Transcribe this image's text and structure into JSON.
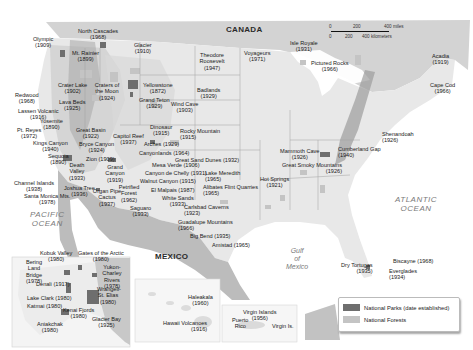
{
  "map": {
    "countries": {
      "canada": "CANADA",
      "mexico": "MEXICO"
    },
    "oceans": {
      "pacific": "PACIFIC\nOCEAN",
      "atlantic": "ATLANTIC\nOCEAN",
      "gulf": "Gulf\nof\nMexico"
    },
    "scale": {
      "miles": [
        "0",
        "200",
        "400 miles"
      ],
      "km": [
        "0",
        "200",
        "400 kilometers"
      ]
    },
    "parks": [
      {
        "name": "Olympic",
        "year": "1909"
      },
      {
        "name": "North Cascades",
        "year": "1968"
      },
      {
        "name": "Mt. Rainier",
        "year": "1899"
      },
      {
        "name": "Glacier",
        "year": "1910"
      },
      {
        "name": "Crater Lake",
        "year": "1902"
      },
      {
        "name": "Craters of the Moon",
        "year": "1924"
      },
      {
        "name": "Redwood",
        "year": "1968"
      },
      {
        "name": "Lava Beds",
        "year": "1925"
      },
      {
        "name": "Lassen Volcanic",
        "year": "1916"
      },
      {
        "name": "Yosemite",
        "year": "1890"
      },
      {
        "name": "Pt. Reyes",
        "year": "1972"
      },
      {
        "name": "Kings Canyon",
        "year": "1940"
      },
      {
        "name": "Sequoia",
        "year": "1890"
      },
      {
        "name": "Great Basin",
        "year": "1922"
      },
      {
        "name": "Capitol Reef",
        "year": "1937"
      },
      {
        "name": "Bryce Canyon",
        "year": "1924"
      },
      {
        "name": "Zion",
        "year": "1909"
      },
      {
        "name": "Death Valley",
        "year": "1933"
      },
      {
        "name": "Grand Canyon",
        "year": "1919"
      },
      {
        "name": "Channel Islands",
        "year": "1938"
      },
      {
        "name": "Joshua Tree",
        "year": "1936"
      },
      {
        "name": "Organ Pipe Cactus",
        "year": "1937"
      },
      {
        "name": "Petrified Forest",
        "year": "1962"
      },
      {
        "name": "Saguaro",
        "year": "1933"
      },
      {
        "name": "Santa Monica Mts.",
        "year": "1978"
      },
      {
        "name": "Yellowstone",
        "year": "1872"
      },
      {
        "name": "Grand Teton",
        "year": "1929"
      },
      {
        "name": "Wind Cave",
        "year": "1903"
      },
      {
        "name": "Theodore Roosevelt",
        "year": "1947"
      },
      {
        "name": "Badlands",
        "year": "1929"
      },
      {
        "name": "Voyageurs",
        "year": "1971"
      },
      {
        "name": "Isle Royale",
        "year": "1931"
      },
      {
        "name": "Pictured Rocks",
        "year": "1966"
      },
      {
        "name": "Acadia",
        "year": "1919"
      },
      {
        "name": "Cape Cod",
        "year": "1966"
      },
      {
        "name": "Dinosaur",
        "year": "1915"
      },
      {
        "name": "Rocky Mountain",
        "year": "1915"
      },
      {
        "name": "Arches",
        "year": "1929"
      },
      {
        "name": "Canyonlands",
        "year": "1964"
      },
      {
        "name": "Great Sand Dunes",
        "year": "1932"
      },
      {
        "name": "Mesa Verde",
        "year": "1906"
      },
      {
        "name": "Canyon de Chelly",
        "year": "1931"
      },
      {
        "name": "Walnut Canyon",
        "year": "1915"
      },
      {
        "name": "Lake Meredith",
        "year": "1965"
      },
      {
        "name": "Alibates Flint Quarries",
        "year": "1965"
      },
      {
        "name": "El Malpais",
        "year": "1987"
      },
      {
        "name": "White Sands",
        "year": "1933"
      },
      {
        "name": "Carlsbad Caverns",
        "year": "1923"
      },
      {
        "name": "Guadalupe Mountains",
        "year": "1966"
      },
      {
        "name": "Big Bend",
        "year": "1935"
      },
      {
        "name": "Amistad",
        "year": "1965"
      },
      {
        "name": "Hot Springs",
        "year": "1921"
      },
      {
        "name": "Mammoth Cave",
        "year": "1926"
      },
      {
        "name": "Great Smoky Mountains",
        "year": "1926"
      },
      {
        "name": "Cumberland Gap",
        "year": "1940"
      },
      {
        "name": "Shenandoah",
        "year": "1926"
      },
      {
        "name": "Dry Tortugas",
        "year": "1935"
      },
      {
        "name": "Biscayne",
        "year": "1968"
      },
      {
        "name": "Everglades",
        "year": "1934"
      }
    ],
    "alaska": [
      {
        "name": "Kobuk Valley",
        "year": "1980"
      },
      {
        "name": "Gates of the Arctic",
        "year": "1980"
      },
      {
        "name": "Bering Land Bridge",
        "year": "1978"
      },
      {
        "name": "Yukon-Charley Rivers",
        "year": "1978"
      },
      {
        "name": "Denali",
        "year": "1917"
      },
      {
        "name": "Wrangell-St. Elias",
        "year": "1980"
      },
      {
        "name": "Lake Clark",
        "year": "1980"
      },
      {
        "name": "Katmai",
        "year": "1980"
      },
      {
        "name": "Kenai Fjords",
        "year": "1980"
      },
      {
        "name": "Aniakchak",
        "year": "1980"
      },
      {
        "name": "Glacier Bay",
        "year": "1925"
      }
    ],
    "hawaii": [
      {
        "name": "Haleakala",
        "year": "1960"
      },
      {
        "name": "Hawaii Volcanoes",
        "year": "1916"
      }
    ],
    "caribbean": {
      "virgin_islands": {
        "name": "Virgin Islands",
        "year": "1956"
      },
      "puerto_rico": "Puerto\nRico",
      "virgin_is": "Virgin Is."
    }
  },
  "legend": {
    "items": [
      {
        "label": "National Parks (date established)",
        "color": "#6e6e6e"
      },
      {
        "label": "National Forests",
        "color": "#c4c4c4"
      }
    ]
  },
  "colors": {
    "land": "#e6e6e6",
    "canada": "#d2d2d2",
    "mexico": "#b9b9b9",
    "water": "#ffffff",
    "park": "#6e6e6e",
    "forest": "#c4c4c4",
    "border": "#9a9a9a"
  }
}
